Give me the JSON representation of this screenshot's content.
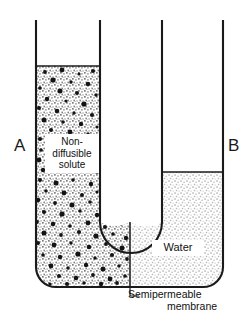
{
  "figure": {
    "type": "diagram",
    "background_color": "#ffffff",
    "ink_color": "#1a1a1a"
  },
  "labels": {
    "arm_left": "A",
    "arm_right": "B",
    "solute": "Non-\ndiffusible\nsolute",
    "solute_lines": [
      "Non-",
      "diffusible",
      "solute"
    ],
    "water": "Water",
    "membrane_line1": "Semipermeable",
    "membrane_line2": "membrane"
  },
  "geometry": {
    "tube_top_y": 20,
    "left_outer_x": 36,
    "left_inner_x": 100,
    "right_inner_x": 162,
    "right_outer_x": 223,
    "left_level_y": 66,
    "right_level_y": 172,
    "inner_bottom_y": 222,
    "outer_bottom_y": 287,
    "membrane_x": 130,
    "membrane_top_y": 222,
    "membrane_bottom_y": 287
  },
  "fills": {
    "solute_side": {
      "name": "non-diffusible-solute-solution",
      "stipple_color": "#8c8c8c",
      "particle_color": "#141414",
      "has_particles": true
    },
    "water_side": {
      "name": "water",
      "stipple_color": "#a8a8a8",
      "particle_color": "",
      "has_particles": false
    }
  }
}
